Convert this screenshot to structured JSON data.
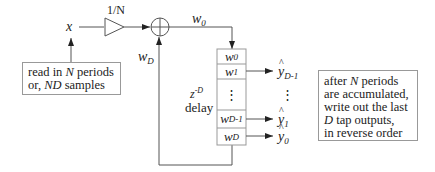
{
  "diagram": {
    "input_label": "x",
    "gain_label": "1/N",
    "sum_output_label": "w0",
    "feedback_label": "wD",
    "delay_label_line1": "z-D",
    "delay_label_line2": "delay",
    "delay_taps": [
      {
        "base": "w",
        "sub": "0"
      },
      {
        "base": "w",
        "sub": "1"
      },
      {
        "base": "⋮",
        "sub": ""
      },
      {
        "base": "w",
        "sub": "D-1"
      },
      {
        "base": "w",
        "sub": "D"
      }
    ],
    "outputs": [
      {
        "base": "y",
        "sub": "D-1",
        "hat": true,
        "tap": "w1"
      },
      {
        "base": "⋮",
        "sub": "",
        "hat": false,
        "tap": "dots"
      },
      {
        "base": "y",
        "sub": "1",
        "hat": true,
        "tap": "wD-1"
      },
      {
        "base": "y",
        "sub": "0",
        "hat": true,
        "tap": "wD"
      }
    ],
    "note_left": {
      "line1": "read in N periods",
      "line2": "or, ND samples"
    },
    "note_right": {
      "line1": "after N periods",
      "line2": "are accumulated,",
      "line3": "write out the last",
      "line4": "D tap outputs,",
      "line5": "in reverse order"
    },
    "colors": {
      "line": "#555555",
      "box_border": "#999999",
      "text": "#222222"
    }
  }
}
